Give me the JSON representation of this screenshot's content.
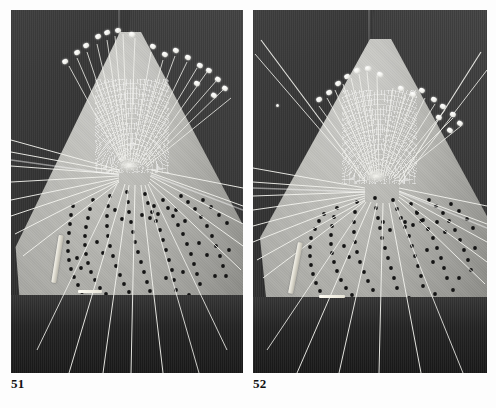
{
  "page": {
    "background_color": "#fdfdfd",
    "kind": "book-plate-page",
    "plate_count": 2
  },
  "plates": [
    {
      "id": "plate-51",
      "caption": "51",
      "subject": "lace pillow with pins and converging threads",
      "frame": {
        "x": 11,
        "y": 10,
        "width": 232,
        "height": 363
      },
      "background_color": "#2a2a2a",
      "pillow_color": "#bdbdb8",
      "thread_color": "#f5f5f0",
      "dot_color": "#141414",
      "pin_count": 17,
      "thread_count": 34,
      "dot_curve_count": 7
    },
    {
      "id": "plate-52",
      "caption": "52",
      "subject": "lace pillow with pins and converging threads, wider thread spread",
      "frame": {
        "x": 253,
        "y": 10,
        "width": 234,
        "height": 363
      },
      "background_color": "#2a2a2a",
      "pillow_color": "#bdbdb8",
      "thread_color": "#f5f5f0",
      "dot_color": "#141414",
      "pin_count": 17,
      "thread_count": 38,
      "dot_curve_count": 7
    }
  ],
  "captions": {
    "left": "51",
    "right": "52"
  },
  "ghost_mark": ""
}
